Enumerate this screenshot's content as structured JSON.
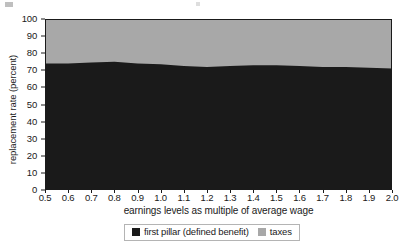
{
  "chart_data": {
    "type": "area",
    "title": "",
    "subtitle": "",
    "xlabel": "earnings levels as multiple of average wage",
    "ylabel": "replacement rate (percent)",
    "xlim": [
      0.5,
      2.0
    ],
    "ylim": [
      0,
      100
    ],
    "grid": false,
    "legend_position": "bottom",
    "stacked": true,
    "x": [
      0.5,
      0.6,
      0.7,
      0.8,
      0.9,
      1.0,
      1.1,
      1.2,
      1.3,
      1.4,
      1.5,
      1.6,
      1.7,
      1.8,
      1.9,
      2.0
    ],
    "x_tick_labels": [
      "0.5",
      "0.6",
      "0.7",
      "0.8",
      "0.9",
      "1.0",
      "1.1",
      "1.2",
      "1.3",
      "1.4",
      "1.5",
      "1.6",
      "1.7",
      "1.8",
      "1.9",
      "2.0"
    ],
    "y_tick_labels": [
      "0",
      "10",
      "20",
      "30",
      "40",
      "50",
      "60",
      "70",
      "80",
      "90",
      "100"
    ],
    "y_ticks": [
      0,
      10,
      20,
      30,
      40,
      50,
      60,
      70,
      80,
      90,
      100
    ],
    "series": [
      {
        "name": "first pillar (defined benefit)",
        "color": "#1a1a1a",
        "values": [
          74,
          74,
          74.5,
          75,
          74,
          73.5,
          72.5,
          72,
          72.5,
          73,
          73,
          72.5,
          72,
          72,
          71.5,
          71
        ]
      },
      {
        "name": "taxes",
        "color": "#a8a8a8",
        "values": [
          26,
          26,
          25.5,
          25,
          26,
          26.5,
          27.5,
          28,
          27.5,
          27,
          27,
          27.5,
          28,
          28,
          28.5,
          29
        ]
      }
    ]
  },
  "legend": {
    "entries": [
      {
        "label": "first pillar (defined benefit)",
        "color": "#1a1a1a"
      },
      {
        "label": "taxes",
        "color": "#a8a8a8"
      }
    ]
  },
  "colors": {
    "first_pillar": "#1a1a1a",
    "taxes": "#a8a8a8",
    "axis": "#1a1a1a",
    "background": "#ffffff",
    "legend_border": "#b4b4b4"
  }
}
